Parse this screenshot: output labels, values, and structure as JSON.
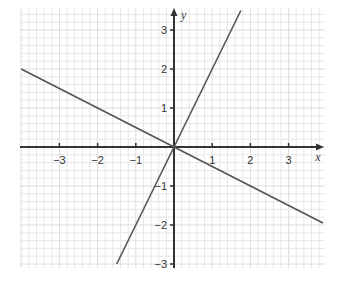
{
  "chart_data": {
    "type": "line",
    "title": "",
    "xlabel": "x",
    "ylabel": "y",
    "xlim": [
      -4,
      4
    ],
    "ylim": [
      -3.1,
      3.6
    ],
    "x_ticks": [
      -3,
      -2,
      -1,
      1,
      2,
      3
    ],
    "y_ticks": [
      -3,
      -2,
      -1,
      1,
      2,
      3
    ],
    "x_tick_labels": [
      "−3",
      "−2",
      "−1",
      "1",
      "2",
      "3"
    ],
    "y_tick_labels": [
      "−3",
      "−2",
      "−1",
      "1",
      "2",
      "3"
    ],
    "grid": true,
    "grid_minor_per_unit": 5,
    "legend": null,
    "series": [
      {
        "name": "y = 2x",
        "slope": 2,
        "intercept": 0,
        "x": [
          -1.5,
          1.75
        ],
        "y": [
          -3,
          3.5
        ]
      },
      {
        "name": "y = -0.5x",
        "slope": -0.5,
        "intercept": 0,
        "x": [
          -4,
          3.9
        ],
        "y": [
          2,
          -1.95
        ]
      }
    ]
  },
  "colors": {
    "grid": "#e6e6e6",
    "axis": "#333333",
    "line": "#555555"
  }
}
